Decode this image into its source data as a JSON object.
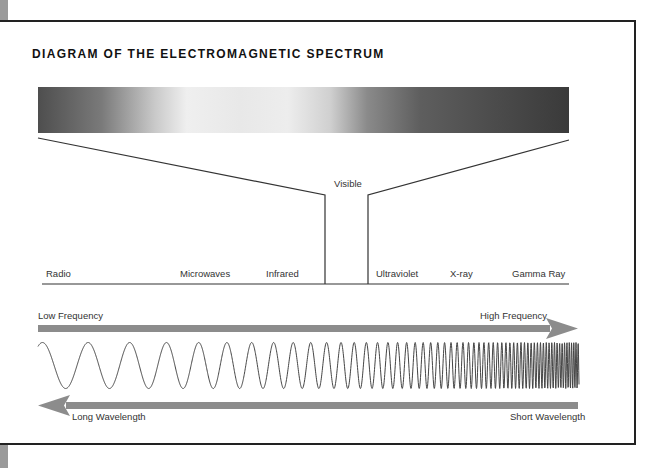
{
  "title": "DIAGRAM OF THE ELECTROMAGNETIC SPECTRUM",
  "spectrum": {
    "visible_label": "Visible",
    "bands": [
      {
        "label": "Radio",
        "x": 46
      },
      {
        "label": "Microwaves",
        "x": 180
      },
      {
        "label": "Infrared",
        "x": 266
      },
      {
        "label": "Ultraviolet",
        "x": 376
      },
      {
        "label": "X-ray",
        "x": 450
      },
      {
        "label": "Gamma Ray",
        "x": 512
      }
    ]
  },
  "frequency_arrow": {
    "left_label": "Low Frequency",
    "right_label": "High Frequency",
    "direction": "right"
  },
  "wavelength_arrow": {
    "left_label": "Long Wavelength",
    "right_label": "Short Wavelength",
    "direction": "left"
  },
  "colors": {
    "line": "#333333",
    "arrow": "#8c8c8c",
    "frame": "#222222"
  }
}
